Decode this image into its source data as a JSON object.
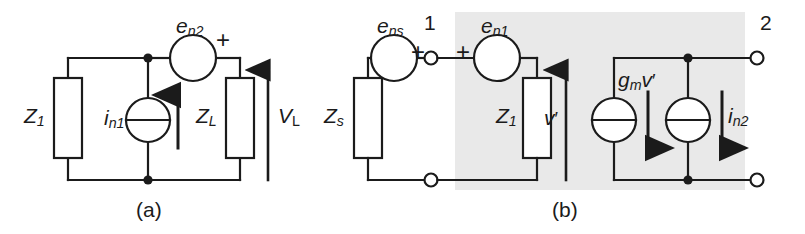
{
  "figure": {
    "stroke_color": "#1b1b1b",
    "shade_color": "#e8e8e8",
    "background": "#ffffff"
  },
  "panel_a": {
    "caption": "(a)",
    "labels": {
      "z1": "Z",
      "z1_sub": "1",
      "zl": "Z",
      "zl_sub": "L",
      "in1": "i",
      "in1_sub": "n1",
      "en2": "e",
      "en2_sub": "n2",
      "vl": "V",
      "vl_sub": "L",
      "plus": "+"
    },
    "elements": [
      {
        "name": "impedance-z1",
        "type": "impedance"
      },
      {
        "name": "impedance-zl",
        "type": "impedance"
      },
      {
        "name": "current-source-in1",
        "type": "current-source"
      },
      {
        "name": "voltage-source-en2",
        "type": "voltage-source"
      },
      {
        "name": "current-arrow-in1",
        "type": "arrow",
        "direction": "up"
      },
      {
        "name": "voltage-arrow-vl",
        "type": "arrow",
        "direction": "up"
      }
    ]
  },
  "panel_b": {
    "caption": "(b)",
    "labels": {
      "zs": "Z",
      "zs_sub": "s",
      "z1": "Z",
      "z1_sub": "1",
      "ens": "e",
      "ens_sub": "ns",
      "en1": "e",
      "en1_sub": "n1",
      "in2": "i",
      "in2_sub": "n2",
      "gm": "g",
      "gm_sub": "m",
      "gm_v": "v",
      "gm_prime": "′",
      "vprime": "v",
      "vprime_mark": "′",
      "plus_ens": "+",
      "plus_en1": "+",
      "terminal_1": "1",
      "terminal_2": "2"
    },
    "elements": [
      {
        "name": "impedance-zs",
        "type": "impedance"
      },
      {
        "name": "impedance-z1",
        "type": "impedance"
      },
      {
        "name": "voltage-source-ens",
        "type": "voltage-source"
      },
      {
        "name": "voltage-source-en1",
        "type": "voltage-source"
      },
      {
        "name": "current-source-gmv",
        "type": "current-source"
      },
      {
        "name": "current-source-in2",
        "type": "current-source"
      },
      {
        "name": "terminal-node-1-top",
        "type": "open-terminal"
      },
      {
        "name": "terminal-node-1-bottom",
        "type": "open-terminal"
      },
      {
        "name": "terminal-node-2-top",
        "type": "open-terminal"
      },
      {
        "name": "terminal-node-2-bottom",
        "type": "open-terminal"
      },
      {
        "name": "voltage-arrow-vprime",
        "type": "arrow",
        "direction": "up"
      },
      {
        "name": "current-arrow-gmv",
        "type": "arrow",
        "direction": "down"
      },
      {
        "name": "current-arrow-in2",
        "type": "arrow",
        "direction": "down"
      },
      {
        "name": "shaded-region-device",
        "type": "shaded-region"
      }
    ]
  }
}
